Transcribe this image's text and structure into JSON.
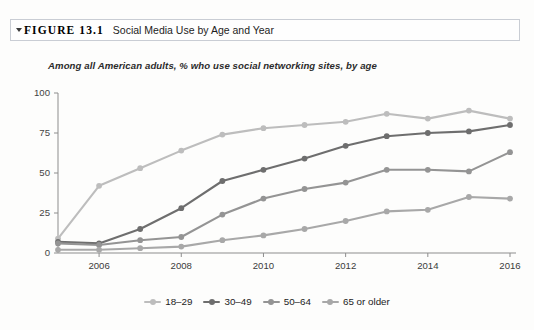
{
  "figure": {
    "marker_icon": "triangle-right-icon",
    "label": "FIGURE 13.1",
    "title": "Social Media Use by Age and Year"
  },
  "chart_data": {
    "type": "line",
    "title": "Social Media Use by Age and Year",
    "subtitle": "Among all American adults, % who use social networking sites, by age",
    "xlabel": "",
    "ylabel": "",
    "x": [
      2005,
      2006,
      2007,
      2008,
      2009,
      2010,
      2011,
      2012,
      2013,
      2014,
      2015,
      2016
    ],
    "xtick_labels": [
      "2006",
      "2008",
      "2010",
      "2012",
      "2014",
      "2016"
    ],
    "xticks": [
      2006,
      2008,
      2010,
      2012,
      2014,
      2016
    ],
    "xlim": [
      2005,
      2016
    ],
    "ytick_labels": [
      "0",
      "25",
      "50",
      "75",
      "100"
    ],
    "yticks": [
      0,
      25,
      50,
      75,
      100
    ],
    "ylim": [
      0,
      100
    ],
    "grid": false,
    "legend_position": "bottom",
    "series": [
      {
        "name": "18–29",
        "color": "#bdbdbd",
        "values": [
          9,
          42,
          53,
          64,
          74,
          78,
          80,
          82,
          87,
          84,
          89,
          84
        ]
      },
      {
        "name": "30–49",
        "color": "#6e6e6e",
        "values": [
          7,
          6,
          15,
          28,
          45,
          52,
          59,
          67,
          73,
          75,
          76,
          80
        ]
      },
      {
        "name": "50–64",
        "color": "#949494",
        "values": [
          6,
          5,
          8,
          10,
          24,
          34,
          40,
          44,
          52,
          52,
          51,
          63
        ]
      },
      {
        "name": "65 or older",
        "color": "#a8a8a8",
        "values": [
          2,
          2,
          3,
          4,
          8,
          11,
          15,
          20,
          26,
          27,
          35,
          34
        ]
      }
    ]
  },
  "legend": {
    "items": [
      {
        "label": "18–29",
        "color": "#bdbdbd"
      },
      {
        "label": "30–49",
        "color": "#6e6e6e"
      },
      {
        "label": "50–64",
        "color": "#949494"
      },
      {
        "label": "65 or older",
        "color": "#a8a8a8"
      }
    ]
  }
}
